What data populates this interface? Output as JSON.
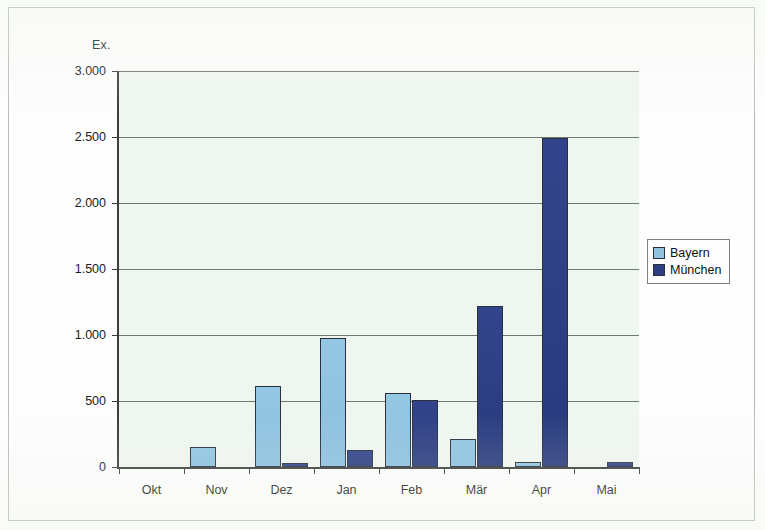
{
  "chart_data": {
    "type": "bar",
    "title": "",
    "subtitle": "",
    "unit_label": "Ex.",
    "xlabel": "",
    "ylabel": "Ex.",
    "categories": [
      "Okt",
      "Nov",
      "Dez",
      "Jan",
      "Feb",
      "Mär",
      "Apr",
      "Mai"
    ],
    "series": [
      {
        "name": "Bayern",
        "color": "#8fc4e0",
        "values": [
          0,
          150,
          610,
          975,
          560,
          210,
          40,
          0
        ]
      },
      {
        "name": "München",
        "color": "#2c3f84",
        "values": [
          0,
          0,
          30,
          130,
          510,
          1220,
          2490,
          40
        ]
      }
    ],
    "ylim": [
      0,
      3000
    ],
    "ytick_values": [
      0,
      500,
      1000,
      1500,
      2000,
      2500,
      3000
    ],
    "ytick_labels": [
      "0",
      "500",
      "1.000",
      "1.500",
      "2.000",
      "2.500",
      "3.000"
    ],
    "grid": true,
    "grid_axis": "y",
    "legend_position": "right",
    "legend_entries": [
      "Bayern",
      "München"
    ]
  },
  "colors": {
    "bayern": "#8fc4e0",
    "muenchen": "#2c3f84",
    "axis": "#3c3c3c",
    "grid": "#6f7a6f",
    "plot_background": "#eff5ef"
  }
}
